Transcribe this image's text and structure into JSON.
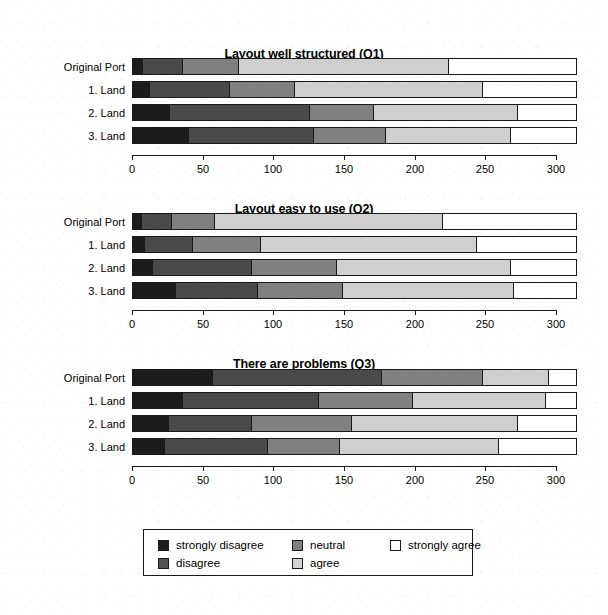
{
  "figure": {
    "axis": {
      "min": 0,
      "max": 300,
      "bar_max": 315,
      "ticks": [
        0,
        50,
        100,
        150,
        200,
        250,
        300
      ]
    },
    "categories": [
      "Original Port",
      "1. Land",
      "2. Land",
      "3. Land"
    ],
    "series_names": [
      "strongly disagree",
      "disagree",
      "neutral",
      "agree",
      "strongly agree"
    ]
  },
  "legend": {
    "items": [
      {
        "key": "sd",
        "label": "strongly disagree"
      },
      {
        "key": "d",
        "label": "disagree"
      },
      {
        "key": "n",
        "label": "neutral"
      },
      {
        "key": "a",
        "label": "agree"
      },
      {
        "key": "sa",
        "label": "strongly agree"
      }
    ]
  },
  "colors": {
    "strongly_disagree": "#1c1c1c",
    "disagree": "#4a4a4a",
    "neutral": "#808080",
    "agree": "#cfcfcf",
    "strongly_agree": "#ffffff",
    "outline": "#1a1a1a"
  },
  "chart_data": [
    {
      "type": "bar",
      "orientation": "horizontal",
      "stacked": true,
      "title": "Layout well structured (Q1)",
      "xlabel": "",
      "ylabel": "",
      "xlim": [
        0,
        315
      ],
      "grid": false,
      "legend_position": "bottom",
      "xticks": [
        0,
        50,
        100,
        150,
        200,
        250,
        300
      ],
      "categories": [
        "Original Port",
        "1. Land",
        "2. Land",
        "3. Land"
      ],
      "series": [
        {
          "name": "strongly disagree",
          "values": [
            8,
            13,
            27,
            40
          ]
        },
        {
          "name": "disagree",
          "values": [
            28,
            56,
            99,
            89
          ]
        },
        {
          "name": "neutral",
          "values": [
            40,
            46,
            45,
            51
          ]
        },
        {
          "name": "agree",
          "values": [
            148,
            133,
            102,
            88
          ]
        },
        {
          "name": "strongly agree",
          "values": [
            91,
            67,
            42,
            47
          ]
        }
      ],
      "cumulative": [
        [
          8,
          36,
          76,
          224,
          315
        ],
        [
          13,
          69,
          115,
          248,
          315
        ],
        [
          27,
          126,
          171,
          273,
          315
        ],
        [
          40,
          129,
          180,
          268,
          315
        ]
      ]
    },
    {
      "type": "bar",
      "orientation": "horizontal",
      "stacked": true,
      "title": "Layout easy to use (Q2)",
      "xlabel": "",
      "ylabel": "",
      "xlim": [
        0,
        315
      ],
      "grid": false,
      "legend_position": "bottom",
      "xticks": [
        0,
        50,
        100,
        150,
        200,
        250,
        300
      ],
      "categories": [
        "Original Port",
        "1. Land",
        "2. Land",
        "3. Land"
      ],
      "series": [
        {
          "name": "strongly disagree",
          "values": [
            7,
            9,
            15,
            31
          ]
        },
        {
          "name": "disagree",
          "values": [
            21,
            34,
            70,
            58
          ]
        },
        {
          "name": "neutral",
          "values": [
            31,
            48,
            60,
            60
          ]
        },
        {
          "name": "agree",
          "values": [
            161,
            153,
            123,
            121
          ]
        },
        {
          "name": "strongly agree",
          "values": [
            95,
            71,
            47,
            45
          ]
        }
      ],
      "cumulative": [
        [
          7,
          28,
          59,
          220,
          315
        ],
        [
          9,
          43,
          91,
          244,
          315
        ],
        [
          15,
          85,
          145,
          268,
          315
        ],
        [
          31,
          89,
          149,
          270,
          315
        ]
      ]
    },
    {
      "type": "bar",
      "orientation": "horizontal",
      "stacked": true,
      "title": "There are problems (Q3)",
      "xlabel": "",
      "ylabel": "",
      "xlim": [
        0,
        315
      ],
      "grid": false,
      "legend_position": "bottom",
      "xticks": [
        0,
        50,
        100,
        150,
        200,
        250,
        300
      ],
      "categories": [
        "Original Port",
        "1. Land",
        "2. Land",
        "3. Land"
      ],
      "series": [
        {
          "name": "strongly disagree",
          "values": [
            57,
            36,
            26,
            23
          ]
        },
        {
          "name": "disagree",
          "values": [
            120,
            96,
            59,
            73
          ]
        },
        {
          "name": "neutral",
          "values": [
            71,
            67,
            71,
            51
          ]
        },
        {
          "name": "agree",
          "values": [
            47,
            94,
            117,
            113
          ]
        },
        {
          "name": "strongly agree",
          "values": [
            20,
            22,
            42,
            55
          ]
        }
      ],
      "cumulative": [
        [
          57,
          177,
          248,
          295,
          315
        ],
        [
          36,
          132,
          199,
          293,
          315
        ],
        [
          26,
          85,
          156,
          273,
          315
        ],
        [
          23,
          96,
          147,
          260,
          315
        ]
      ]
    }
  ]
}
